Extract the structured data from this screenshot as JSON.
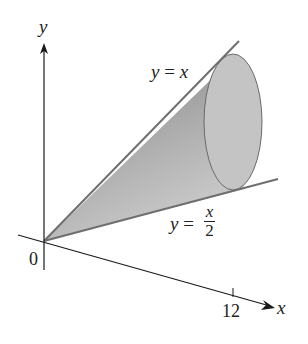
{
  "figure": {
    "type": "cone-of-revolution",
    "colors": {
      "axis": "#1a1a1a",
      "line": "#6f6f6f",
      "cone_dark": "#8a8a8a",
      "cone_light": "#d6d6d6",
      "ellipse_fill": "#c4c4c4",
      "ellipse_stroke": "#6a6a6a"
    }
  },
  "axes": {
    "y_label": "y",
    "x_label": "x",
    "origin_label": "0",
    "x_tick_label": "12"
  },
  "curves": {
    "upper": {
      "lhs": "y",
      "eq": "=",
      "rhs": "x"
    },
    "lower": {
      "lhs": "y",
      "eq": "=",
      "numerator": "x",
      "denominator": "2"
    }
  }
}
